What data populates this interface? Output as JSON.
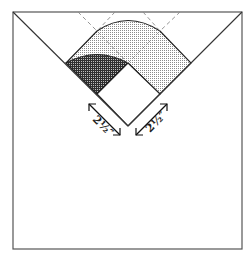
{
  "diagram": {
    "type": "folding-pattern",
    "colors": {
      "line": "#333333",
      "dashed": "#888888",
      "light_fill": "#cfcfcf",
      "dark_fill": "#555555",
      "background": "#ffffff"
    },
    "labels": {
      "left_measure": "2½″",
      "right_measure": "2½″"
    },
    "outer_square": {
      "x": 13,
      "y": 12,
      "w": 229,
      "h": 237
    }
  }
}
